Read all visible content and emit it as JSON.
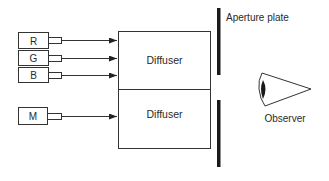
{
  "diagram": {
    "sources": [
      {
        "label": "R",
        "name": "red"
      },
      {
        "label": "G",
        "name": "green"
      },
      {
        "label": "B",
        "name": "blue"
      },
      {
        "label": "M",
        "name": "matching"
      }
    ],
    "diffusers": [
      {
        "label": "Diffuser"
      },
      {
        "label": "Diffuser"
      }
    ],
    "aperture_plate": {
      "label": "Aperture plate"
    },
    "observer": {
      "label": "Observer"
    },
    "colors": {
      "stroke": "#333333",
      "plate": "#1a1a1a",
      "background": "#ffffff"
    }
  }
}
